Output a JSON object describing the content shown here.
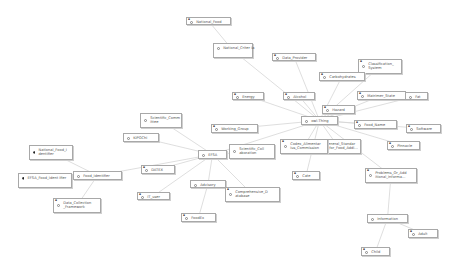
{
  "diagram": {
    "type": "ontology-graph",
    "root": "owl:Thing",
    "nodes": [
      {
        "id": "national_food",
        "label": "National_Food",
        "type": "class",
        "x": 186,
        "y": 17,
        "w": 45,
        "h": 8,
        "corner": true
      },
      {
        "id": "national_criteria",
        "label": "National_Criter ia",
        "type": "class",
        "x": 213,
        "y": 43,
        "w": 40,
        "h": 15,
        "corner": false
      },
      {
        "id": "data_provider",
        "label": "Data_Provider",
        "type": "class",
        "x": 272,
        "y": 53,
        "w": 44,
        "h": 8,
        "corner": true
      },
      {
        "id": "classification_system",
        "label": "Classification_ System",
        "type": "class",
        "x": 358,
        "y": 59,
        "w": 44,
        "h": 15,
        "corner": true
      },
      {
        "id": "carbohydrates",
        "label": "Carbohydrates",
        "type": "class",
        "x": 319,
        "y": 72,
        "w": 46,
        "h": 9,
        "corner": true
      },
      {
        "id": "alcohol",
        "label": "Alcohol",
        "type": "class",
        "x": 283,
        "y": 92,
        "w": 32,
        "h": 8,
        "corner": true
      },
      {
        "id": "energy",
        "label": "Energy",
        "type": "class",
        "x": 232,
        "y": 92,
        "w": 32,
        "h": 8,
        "corner": true
      },
      {
        "id": "matrimer_state",
        "label": "Matrimer_State",
        "type": "class",
        "x": 357,
        "y": 91,
        "w": 49,
        "h": 9,
        "corner": true
      },
      {
        "id": "fat",
        "label": "Fat",
        "type": "class",
        "x": 405,
        "y": 92,
        "w": 23,
        "h": 8,
        "corner": false
      },
      {
        "id": "hazard",
        "label": "Hazard",
        "type": "class",
        "x": 322,
        "y": 105,
        "w": 33,
        "h": 9,
        "corner": true
      },
      {
        "id": "owl_thing",
        "label": "owl:Thing",
        "type": "class",
        "x": 301,
        "y": 116,
        "w": 37,
        "h": 9,
        "corner": false
      },
      {
        "id": "food_name",
        "label": "Food_Name",
        "type": "class",
        "x": 354,
        "y": 120,
        "w": 43,
        "h": 9,
        "corner": true
      },
      {
        "id": "software",
        "label": "Software",
        "type": "class",
        "x": 406,
        "y": 124,
        "w": 35,
        "h": 9,
        "corner": true
      },
      {
        "id": "scientific_committee",
        "label": "Scientific_Comm ittee",
        "type": "class",
        "x": 140,
        "y": 113,
        "w": 42,
        "h": 15,
        "corner": false
      },
      {
        "id": "working_group",
        "label": "Working_Group",
        "type": "class",
        "x": 211,
        "y": 124,
        "w": 47,
        "h": 9,
        "corner": true
      },
      {
        "id": "general_standard",
        "label": "General_Standar d_for_Food_Addi...",
        "type": "class",
        "x": 315,
        "y": 139,
        "w": 46,
        "h": 15,
        "corner": false
      },
      {
        "id": "codex",
        "label": "Codex_Alimentar ius_Commission",
        "type": "class",
        "x": 280,
        "y": 139,
        "w": 48,
        "h": 15,
        "corner": true
      },
      {
        "id": "pinnacle",
        "label": "Pinnacle",
        "type": "class",
        "x": 387,
        "y": 141,
        "w": 33,
        "h": 9,
        "corner": true
      },
      {
        "id": "efsa",
        "label": "EFSA",
        "type": "class",
        "x": 198,
        "y": 150,
        "w": 29,
        "h": 9,
        "corner": false
      },
      {
        "id": "scientific_cooperation",
        "label": "Scientific_Coll aboration",
        "type": "class",
        "x": 229,
        "y": 144,
        "w": 46,
        "h": 15,
        "corner": false
      },
      {
        "id": "kiproche",
        "label": "KIPOChi",
        "type": "class",
        "x": 123,
        "y": 133,
        "w": 36,
        "h": 9,
        "corner": false
      },
      {
        "id": "national_food_identifier",
        "label": "National_Food_I dentifier",
        "type": "individual",
        "x": 29,
        "y": 145,
        "w": 44,
        "h": 15,
        "corner": false
      },
      {
        "id": "food_identifier",
        "label": "Food_Identifier",
        "type": "class",
        "x": 73,
        "y": 171,
        "w": 49,
        "h": 9,
        "corner": false
      },
      {
        "id": "efsa_food_identifier",
        "label": "EFSA_Food_Ident ifier",
        "type": "individual",
        "x": 18,
        "y": 173,
        "w": 54,
        "h": 15,
        "corner": false
      },
      {
        "id": "datex",
        "label": "DATEX",
        "type": "class",
        "x": 141,
        "y": 165,
        "w": 34,
        "h": 9,
        "corner": true
      },
      {
        "id": "cate",
        "label": "Cate",
        "type": "class",
        "x": 292,
        "y": 171,
        "w": 28,
        "h": 9,
        "corner": true
      },
      {
        "id": "problems",
        "label": "Problems_Or_Add itional_Informa...",
        "type": "class",
        "x": 365,
        "y": 168,
        "w": 52,
        "h": 15,
        "corner": true
      },
      {
        "id": "advisory",
        "label": "Advisory",
        "type": "class",
        "x": 190,
        "y": 180,
        "w": 36,
        "h": 8,
        "corner": false
      },
      {
        "id": "comprehensive_database",
        "label": "Comprehensive_D atabase",
        "type": "class",
        "x": 225,
        "y": 187,
        "w": 55,
        "h": 15,
        "corner": true
      },
      {
        "id": "it_user",
        "label": "IT_user",
        "type": "class",
        "x": 137,
        "y": 192,
        "w": 33,
        "h": 8,
        "corner": true
      },
      {
        "id": "data_collection_framework",
        "label": "Data_Collection _Framework",
        "type": "class",
        "x": 53,
        "y": 198,
        "w": 48,
        "h": 15,
        "corner": true
      },
      {
        "id": "fooddex",
        "label": "FoodEx",
        "type": "class",
        "x": 181,
        "y": 213,
        "w": 35,
        "h": 9,
        "corner": true
      },
      {
        "id": "information",
        "label": "Information",
        "type": "class",
        "x": 367,
        "y": 214,
        "w": 41,
        "h": 9,
        "corner": false
      },
      {
        "id": "adult",
        "label": "Adult",
        "type": "class",
        "x": 408,
        "y": 229,
        "w": 30,
        "h": 9,
        "corner": true
      },
      {
        "id": "child",
        "label": "Child",
        "type": "class",
        "x": 361,
        "y": 247,
        "w": 29,
        "h": 9,
        "corner": true
      }
    ],
    "edges": [
      [
        "national_food",
        "national_criteria"
      ],
      [
        "national_criteria",
        "owl_thing"
      ],
      [
        "data_provider",
        "owl_thing"
      ],
      [
        "classification_system",
        "owl_thing"
      ],
      [
        "carbohydrates",
        "owl_thing"
      ],
      [
        "alcohol",
        "owl_thing"
      ],
      [
        "energy",
        "owl_thing"
      ],
      [
        "matrimer_state",
        "owl_thing"
      ],
      [
        "fat",
        "owl_thing"
      ],
      [
        "hazard",
        "owl_thing"
      ],
      [
        "food_name",
        "owl_thing"
      ],
      [
        "software",
        "owl_thing"
      ],
      [
        "pinnacle",
        "owl_thing"
      ],
      [
        "general_standard",
        "owl_thing"
      ],
      [
        "codex",
        "owl_thing"
      ],
      [
        "cate",
        "owl_thing"
      ],
      [
        "problems",
        "owl_thing"
      ],
      [
        "information",
        "problems"
      ],
      [
        "adult",
        "information"
      ],
      [
        "child",
        "information"
      ],
      [
        "working_group",
        "owl_thing"
      ],
      [
        "efsa",
        "owl_thing"
      ],
      [
        "scientific_committee",
        "efsa"
      ],
      [
        "scientific_cooperation",
        "efsa"
      ],
      [
        "kiproche",
        "efsa"
      ],
      [
        "datex",
        "efsa"
      ],
      [
        "food_identifier",
        "efsa"
      ],
      [
        "national_food_identifier",
        "food_identifier"
      ],
      [
        "efsa_food_identifier",
        "food_identifier"
      ],
      [
        "data_collection_framework",
        "food_identifier"
      ],
      [
        "advisory",
        "efsa"
      ],
      [
        "comprehensive_database",
        "efsa"
      ],
      [
        "it_user",
        "efsa"
      ],
      [
        "fooddex",
        "advisory"
      ]
    ]
  },
  "colors": {
    "background": "#ffffff",
    "edge": "#d6d6d6",
    "node_border": "#a8a8a8",
    "node_text": "#555555"
  }
}
